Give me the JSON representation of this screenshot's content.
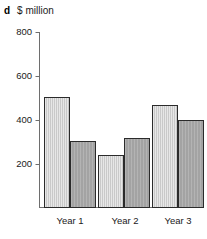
{
  "panel": {
    "letter": "d",
    "axis_title": "$ million"
  },
  "chart_data": {
    "type": "bar",
    "title": "$ million",
    "panel_label": "d",
    "xlabel": "",
    "ylabel": "$ million",
    "ylim": [
      0,
      800
    ],
    "yticks": [
      200,
      400,
      600,
      800
    ],
    "ytick_labels": [
      "200",
      "400",
      "600",
      "800"
    ],
    "grid": false,
    "legend": "none",
    "categories": [
      "Year 1",
      "Year 2",
      "Year 3"
    ],
    "series": [
      {
        "name": "Series 1",
        "color": "#c9c9c9",
        "values": [
          505,
          243,
          470
        ]
      },
      {
        "name": "Series 2",
        "color": "#a3a3a3",
        "values": [
          303,
          320,
          400
        ]
      }
    ]
  },
  "colors": {
    "series_light": "#c9c9c9",
    "series_dark": "#a3a3a3",
    "axis": "#6e6e6e",
    "bar_outline": "#2b2b2b",
    "text": "#1a1a1a",
    "background": "#ffffff"
  }
}
